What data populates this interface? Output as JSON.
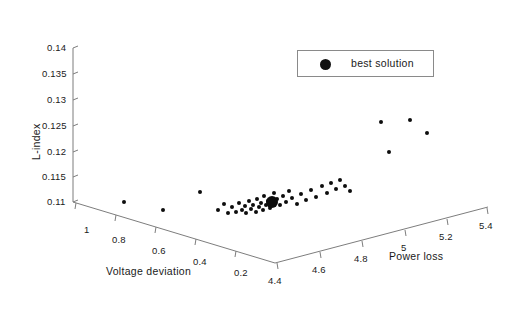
{
  "chart_data": {
    "type": "scatter",
    "projection": "3d",
    "title": "",
    "xlabel": "Voltage deviation",
    "ylabel": "Power loss",
    "zlabel": "L-index",
    "grid": false,
    "axes": {
      "z": {
        "name": "L-index",
        "ticks": [
          "0.11",
          "0.115",
          "0.12",
          "0.125",
          "0.13",
          "0.135",
          "0.14"
        ],
        "range": [
          0.11,
          0.14
        ]
      },
      "x": {
        "name": "Voltage deviation",
        "ticks": [
          "1",
          "0.8",
          "0.6",
          "0.4",
          "0.2"
        ],
        "range": [
          1.0,
          0.2
        ],
        "direction": "descending"
      },
      "y": {
        "name": "Power loss",
        "ticks": [
          "4.4",
          "4.6",
          "4.8",
          "5",
          "5.2",
          "5.4"
        ],
        "range": [
          4.4,
          5.4
        ],
        "direction": "ascending"
      }
    },
    "legend": {
      "position": "top-right",
      "entries": [
        {
          "label": "best solution",
          "marker": "filled-circle",
          "color": "#111111"
        }
      ]
    },
    "series": [
      {
        "name": "pareto front",
        "marker": "filled-circle",
        "color": "#0d0d0d",
        "points": [
          {
            "px": 124,
            "py": 202,
            "r": 2.3
          },
          {
            "px": 163,
            "py": 210,
            "r": 2.3
          },
          {
            "px": 200,
            "py": 192,
            "r": 2.3
          },
          {
            "px": 218,
            "py": 210,
            "r": 2.3
          },
          {
            "px": 224,
            "py": 204,
            "r": 2.3
          },
          {
            "px": 228,
            "py": 213,
            "r": 2.3
          },
          {
            "px": 232,
            "py": 207,
            "r": 2.3
          },
          {
            "px": 236,
            "py": 212,
            "r": 2.3
          },
          {
            "px": 239,
            "py": 203,
            "r": 2.3
          },
          {
            "px": 242,
            "py": 210,
            "r": 2.3
          },
          {
            "px": 245,
            "py": 206,
            "r": 2.3
          },
          {
            "px": 246,
            "py": 213,
            "r": 2.3
          },
          {
            "px": 249,
            "py": 201,
            "r": 2.3
          },
          {
            "px": 251,
            "py": 209,
            "r": 2.3
          },
          {
            "px": 253,
            "py": 205,
            "r": 2.3
          },
          {
            "px": 256,
            "py": 212,
            "r": 2.3
          },
          {
            "px": 257,
            "py": 199,
            "r": 2.3
          },
          {
            "px": 259,
            "py": 207,
            "r": 2.3
          },
          {
            "px": 261,
            "py": 203,
            "r": 2.3
          },
          {
            "px": 263,
            "py": 210,
            "r": 2.3
          },
          {
            "px": 264,
            "py": 196,
            "r": 2.3
          },
          {
            "px": 266,
            "py": 205,
            "r": 2.3
          },
          {
            "px": 268,
            "py": 201,
            "r": 2.3
          },
          {
            "px": 270,
            "py": 208,
            "r": 2.3
          },
          {
            "px": 274,
            "py": 193,
            "r": 2.3
          },
          {
            "px": 277,
            "py": 199,
            "r": 2.3
          },
          {
            "px": 280,
            "py": 205,
            "r": 2.3
          },
          {
            "px": 283,
            "py": 196,
            "r": 2.3
          },
          {
            "px": 286,
            "py": 202,
            "r": 2.3
          },
          {
            "px": 289,
            "py": 191,
            "r": 2.3
          },
          {
            "px": 292,
            "py": 198,
            "r": 2.3
          },
          {
            "px": 297,
            "py": 204,
            "r": 2.3
          },
          {
            "px": 301,
            "py": 194,
            "r": 2.3
          },
          {
            "px": 306,
            "py": 200,
            "r": 2.3
          },
          {
            "px": 311,
            "py": 190,
            "r": 2.3
          },
          {
            "px": 316,
            "py": 197,
            "r": 2.3
          },
          {
            "px": 322,
            "py": 186,
            "r": 2.3
          },
          {
            "px": 327,
            "py": 193,
            "r": 2.3
          },
          {
            "px": 331,
            "py": 183,
            "r": 2.3
          },
          {
            "px": 336,
            "py": 189,
            "r": 2.3
          },
          {
            "px": 340,
            "py": 180,
            "r": 2.3
          },
          {
            "px": 345,
            "py": 186,
            "r": 2.3
          },
          {
            "px": 350,
            "py": 191,
            "r": 2.3
          },
          {
            "px": 381,
            "py": 122,
            "r": 2.3
          },
          {
            "px": 410,
            "py": 120,
            "r": 2.3
          },
          {
            "px": 427,
            "py": 133,
            "r": 2.3
          },
          {
            "px": 389,
            "py": 152,
            "r": 2.3
          }
        ]
      },
      {
        "name": "best solution",
        "marker": "filled-circle-large",
        "color": "#0d0d0d",
        "points": [
          {
            "px": 272,
            "py": 202,
            "r": 6.2
          }
        ]
      }
    ]
  },
  "axis_tick_positions": {
    "z": [
      {
        "label": "0.14",
        "x": 47,
        "y": 42
      },
      {
        "label": "0.135",
        "x": 42,
        "y": 68
      },
      {
        "label": "0.13",
        "x": 47,
        "y": 94
      },
      {
        "label": "0.125",
        "x": 42,
        "y": 120
      },
      {
        "label": "0.12",
        "x": 47,
        "y": 146
      },
      {
        "label": "0.115",
        "x": 42,
        "y": 172
      },
      {
        "label": "0.11",
        "x": 47,
        "y": 197
      }
    ],
    "x": [
      {
        "label": "1",
        "x": 84,
        "y": 224
      },
      {
        "label": "0.8",
        "x": 115,
        "y": 233
      },
      {
        "label": "0.6",
        "x": 155,
        "y": 243
      },
      {
        "label": "0.4",
        "x": 196,
        "y": 252
      },
      {
        "label": "0.2",
        "x": 237,
        "y": 261
      }
    ],
    "y": [
      {
        "label": "4.4",
        "x": 272,
        "y": 277
      },
      {
        "label": "4.6",
        "x": 315,
        "y": 268
      },
      {
        "label": "4.8",
        "x": 357,
        "y": 258
      },
      {
        "label": "5",
        "x": 403,
        "y": 249
      },
      {
        "label": "5.2",
        "x": 438,
        "y": 239
      },
      {
        "label": "5.4",
        "x": 478,
        "y": 229
      }
    ]
  },
  "axis_titles": {
    "z": {
      "text": "L-index",
      "x": 26,
      "y": 148
    },
    "x": {
      "text": "Voltage deviation",
      "x": 106,
      "y": 268
    },
    "y": {
      "text": "Power loss",
      "x": 390,
      "y": 263
    }
  },
  "legend": {
    "label": "best solution"
  }
}
